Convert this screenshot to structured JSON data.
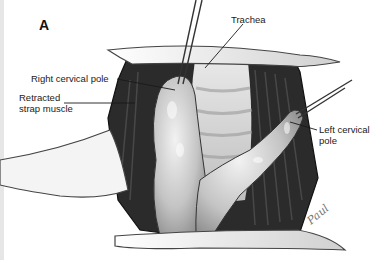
{
  "figure": {
    "panel_letter": "A",
    "labels": {
      "trachea": "Trachea",
      "right_cervical_pole": "Right cervical pole",
      "retracted_strap_muscle_line1": "Retracted",
      "retracted_strap_muscle_line2": "strap muscle",
      "left_cervical_pole_line1": "Left cervical",
      "left_cervical_pole_line2": "pole"
    },
    "signature": "Paul",
    "colors": {
      "background": "#ffffff",
      "ink": "#1a1a1a",
      "tissue_light": "#d8d8d8",
      "tissue_dark": "#2a2a2a"
    }
  }
}
